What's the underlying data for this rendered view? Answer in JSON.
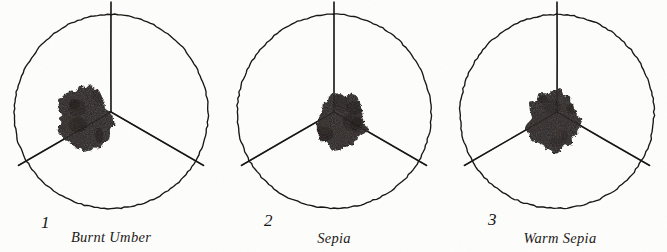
{
  "plate": {
    "kind": "pigment-sample-plate",
    "background_color": "#fdfdfc",
    "ink_color": "#17150f",
    "pigment_color": "#231f1a",
    "width": 667,
    "height": 252
  },
  "samples": [
    {
      "number": "1",
      "caption": "Burnt Umber",
      "panel_left": 0,
      "circle": {
        "cx": 111,
        "cy": 112,
        "r": 97
      },
      "spokes": [
        {
          "label": "up",
          "angle_deg": -90,
          "overshoot": 13
        },
        {
          "label": "lower-left",
          "angle_deg": 150,
          "overshoot": 10
        },
        {
          "label": "lower-right",
          "angle_deg": 30,
          "overshoot": 10
        }
      ],
      "blob": {
        "cx": 85,
        "cy": 119,
        "rx": 27,
        "ry": 32,
        "rotate_deg": -8
      },
      "number_pos": {
        "x": 41,
        "y": 214
      },
      "caption_pos": {
        "x": 111,
        "y": 230
      }
    },
    {
      "number": "2",
      "caption": "Sepia",
      "panel_left": 222,
      "circle": {
        "cx": 112,
        "cy": 112,
        "r": 97
      },
      "spokes": [
        {
          "label": "up",
          "angle_deg": -90,
          "overshoot": 13
        },
        {
          "label": "lower-left",
          "angle_deg": 150,
          "overshoot": 10
        },
        {
          "label": "lower-right",
          "angle_deg": 30,
          "overshoot": 10
        }
      ],
      "blob": {
        "cx": 119,
        "cy": 122,
        "rx": 25,
        "ry": 27,
        "rotate_deg": 6
      },
      "number_pos": {
        "x": 42,
        "y": 212
      },
      "caption_pos": {
        "x": 112,
        "y": 231
      }
    },
    {
      "number": "3",
      "caption": "Warm Sepia",
      "panel_left": 445,
      "circle": {
        "cx": 112,
        "cy": 112,
        "r": 97
      },
      "spokes": [
        {
          "label": "up",
          "angle_deg": -90,
          "overshoot": 13
        },
        {
          "label": "lower-left",
          "angle_deg": 150,
          "overshoot": 10
        },
        {
          "label": "lower-right",
          "angle_deg": 30,
          "overshoot": 10
        }
      ],
      "blob": {
        "cx": 108,
        "cy": 121,
        "rx": 26,
        "ry": 30,
        "rotate_deg": -4
      },
      "number_pos": {
        "x": 43,
        "y": 211
      },
      "caption_pos": {
        "x": 115,
        "y": 231
      }
    }
  ]
}
